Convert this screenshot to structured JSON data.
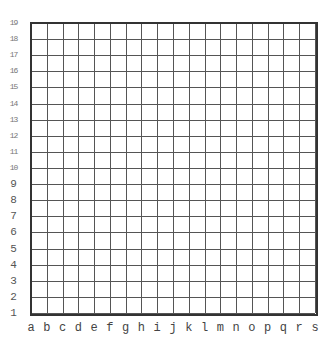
{
  "board": {
    "type": "go",
    "size": 19,
    "stones": [],
    "columns": [
      "a",
      "b",
      "c",
      "d",
      "e",
      "f",
      "g",
      "h",
      "i",
      "j",
      "k",
      "l",
      "m",
      "n",
      "o",
      "p",
      "q",
      "r",
      "s"
    ],
    "rows": [
      "19",
      "18",
      "17",
      "16",
      "15",
      "14",
      "13",
      "12",
      "11",
      "10",
      "9",
      "8",
      "7",
      "6",
      "5",
      "4",
      "3",
      "2",
      "1"
    ],
    "colors": {
      "line": "#555555",
      "border": "#333333",
      "background": "#ffffff"
    }
  }
}
